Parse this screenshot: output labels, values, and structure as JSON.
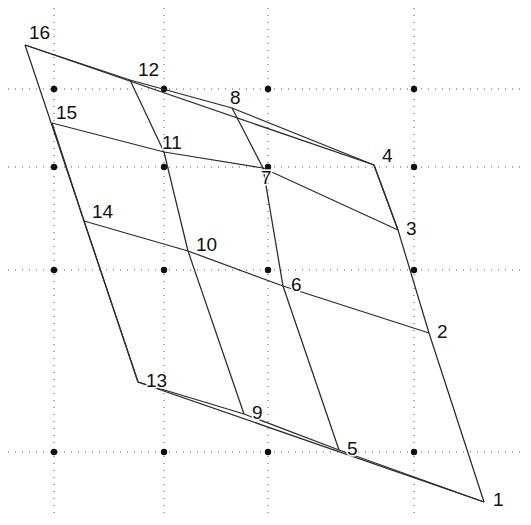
{
  "figure": {
    "width": 531,
    "height": 525,
    "background_color": "#ffffff",
    "stroke_color": "#2b2b2b",
    "grid_color": "#3a3a3a",
    "label_color": "#111111"
  },
  "grid": {
    "style": "dotted",
    "x_positions": [
      54,
      164,
      268,
      414
    ],
    "y_positions": [
      89,
      167,
      270,
      452
    ],
    "node_radius": 3.2,
    "node_color": "#111111"
  },
  "chart_data": {
    "type": "scatter",
    "xlabel": "",
    "ylabel": "",
    "xlim": [
      0,
      531
    ],
    "ylim": [
      0,
      525
    ],
    "grid": true,
    "legend": "none",
    "categories": [
      "1",
      "2",
      "3",
      "4",
      "5",
      "6",
      "7",
      "8",
      "9",
      "10",
      "11",
      "12",
      "13",
      "14",
      "15",
      "16"
    ],
    "points": [
      {
        "label": "1",
        "x": 484,
        "y": 502,
        "label_dx": 9,
        "label_dy": 4
      },
      {
        "label": "2",
        "x": 429,
        "y": 333,
        "label_dx": 8,
        "label_dy": 5
      },
      {
        "label": "3",
        "x": 398,
        "y": 230,
        "label_dx": 8,
        "label_dy": 5
      },
      {
        "label": "4",
        "x": 374,
        "y": 165,
        "label_dx": 8,
        "label_dy": -3
      },
      {
        "label": "5",
        "x": 339,
        "y": 450,
        "label_dx": 8,
        "label_dy": 5
      },
      {
        "label": "6",
        "x": 283,
        "y": 286,
        "label_dx": 8,
        "label_dy": 5
      },
      {
        "label": "7",
        "x": 263,
        "y": 168,
        "label_dx": -2,
        "label_dy": 16
      },
      {
        "label": "8",
        "x": 232,
        "y": 108,
        "label_dx": -2,
        "label_dy": -4
      },
      {
        "label": "9",
        "x": 244,
        "y": 414,
        "label_dx": 8,
        "label_dy": 5
      },
      {
        "label": "10",
        "x": 188,
        "y": 251,
        "label_dx": 8,
        "label_dy": 0
      },
      {
        "label": "11",
        "x": 164,
        "y": 152,
        "label_dx": -2,
        "label_dy": -3
      },
      {
        "label": "12",
        "x": 130,
        "y": 80,
        "label_dx": 8,
        "label_dy": -4
      },
      {
        "label": "13",
        "x": 138,
        "y": 382,
        "label_dx": 8,
        "label_dy": 5
      },
      {
        "label": "14",
        "x": 84,
        "y": 221,
        "label_dx": 8,
        "label_dy": -3
      },
      {
        "label": "15",
        "x": 52,
        "y": 123,
        "label_dx": 4,
        "label_dy": -4
      },
      {
        "label": "16",
        "x": 25,
        "y": 45,
        "label_dx": 4,
        "label_dy": -6
      }
    ],
    "edges": [
      {
        "from": "16",
        "to": "4"
      },
      {
        "from": "4",
        "to": "3"
      },
      {
        "from": "15",
        "to": "3"
      },
      {
        "from": "16",
        "to": "13"
      },
      {
        "from": "13",
        "to": "1"
      },
      {
        "from": "15",
        "to": "13"
      },
      {
        "from": "12",
        "to": "9"
      },
      {
        "from": "14",
        "to": "2"
      },
      {
        "from": "8",
        "to": "5"
      },
      {
        "from": "10",
        "to": "2"
      },
      {
        "from": "6",
        "to": "5"
      },
      {
        "from": "2",
        "to": "1"
      },
      {
        "from": "12",
        "to": "11"
      },
      {
        "from": "11",
        "to": "10"
      },
      {
        "from": "10",
        "to": "9"
      },
      {
        "from": "9",
        "to": "5"
      },
      {
        "from": "14",
        "to": "10"
      },
      {
        "label_note": "polyline-chain"
      }
    ],
    "polylines": [
      {
        "name": "outer-top",
        "vertices": [
          "16",
          "4",
          "3"
        ]
      },
      {
        "name": "outer-left",
        "vertices": [
          "16",
          "13",
          "1"
        ]
      },
      {
        "name": "band-15-3",
        "vertices": [
          "15",
          "11",
          "7",
          "3"
        ]
      },
      {
        "name": "band-14-2",
        "vertices": [
          "14",
          "10",
          "6",
          "2"
        ]
      },
      {
        "name": "band-13-1",
        "vertices": [
          "13",
          "9",
          "5",
          "1"
        ]
      },
      {
        "name": "rail-15-13",
        "vertices": [
          "15",
          "14",
          "13"
        ]
      },
      {
        "name": "rail-12-9",
        "vertices": [
          "12",
          "11",
          "10",
          "9"
        ]
      },
      {
        "name": "rail-8-5",
        "vertices": [
          "8",
          "7",
          "6",
          "5"
        ]
      },
      {
        "name": "rail-4-1",
        "vertices": [
          "4",
          "3",
          "2",
          "1"
        ]
      },
      {
        "name": "top-12-8",
        "vertices": [
          "16",
          "12",
          "8",
          "4"
        ]
      }
    ]
  }
}
